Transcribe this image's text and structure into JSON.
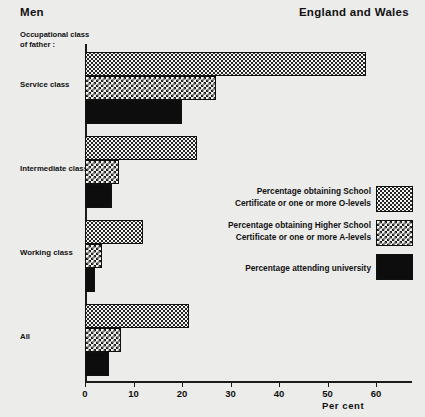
{
  "header": {
    "left_title": "Men",
    "right_title": "England and Wales"
  },
  "axis_caption": "Occupational class\nof father :",
  "x_axis_title": "Per  cent",
  "legend": [
    {
      "label": "Percentage obtaining School\nCertificate or one or more O-levels",
      "pattern": "dots-sparse",
      "swatch_name": "legend-swatch-school-certificate"
    },
    {
      "label": "Percentage obtaining Higher School\nCertificate or one or more A-levels",
      "pattern": "checkerboard",
      "swatch_name": "legend-swatch-higher-school-certificate"
    },
    {
      "label": "Percentage attending university",
      "pattern": "solid-black",
      "swatch_name": "legend-swatch-university"
    }
  ],
  "chart_data": {
    "type": "bar",
    "orientation": "horizontal",
    "title": "Men",
    "subtitle": "England and Wales",
    "xlabel": "Per  cent",
    "ylabel": "Occupational class of father :",
    "xlim": [
      0,
      67
    ],
    "xticks": [
      0,
      10,
      20,
      30,
      40,
      50,
      60
    ],
    "xticklabels": [
      "0",
      "10",
      "20",
      "30",
      "40",
      "50",
      "60"
    ],
    "grid": false,
    "legend_position": "center-right",
    "categories": [
      "Service class",
      "Intermediate class",
      "Working class",
      "All"
    ],
    "series": [
      {
        "name": "Percentage obtaining School Certificate or one or more O-levels",
        "values": [
          58,
          23,
          12,
          21.5
        ]
      },
      {
        "name": "Percentage obtaining Higher School Certificate or one or more A-levels",
        "values": [
          27,
          7,
          3.5,
          7.5
        ]
      },
      {
        "name": "Percentage attending university",
        "values": [
          20,
          5.5,
          2,
          5
        ]
      }
    ]
  }
}
